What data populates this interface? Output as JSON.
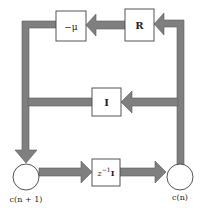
{
  "diagram": {
    "type": "block-diagram",
    "blocks": {
      "neg_mu": {
        "label": "−μ"
      },
      "R": {
        "label": "R"
      },
      "I": {
        "label": "I"
      },
      "delay": {
        "label_base": "z",
        "label_sup": "−1",
        "label_suffix": "I"
      }
    },
    "nodes": {
      "left": {
        "label": "c(n + 1)"
      },
      "right": {
        "label": "c(n)"
      }
    },
    "colors": {
      "pipe": "#7f7f7f",
      "box_border": "#555555",
      "background": "#ffffff"
    },
    "edges": [
      {
        "from": "c(n)",
        "to": "R"
      },
      {
        "from": "R",
        "to": "−μ"
      },
      {
        "from": "−μ",
        "to": "c(n + 1)"
      },
      {
        "from": "c(n)",
        "to": "I"
      },
      {
        "from": "I",
        "to": "c(n + 1)"
      },
      {
        "from": "c(n + 1)",
        "to": "z−1I"
      },
      {
        "from": "z−1I",
        "to": "c(n)"
      }
    ]
  }
}
